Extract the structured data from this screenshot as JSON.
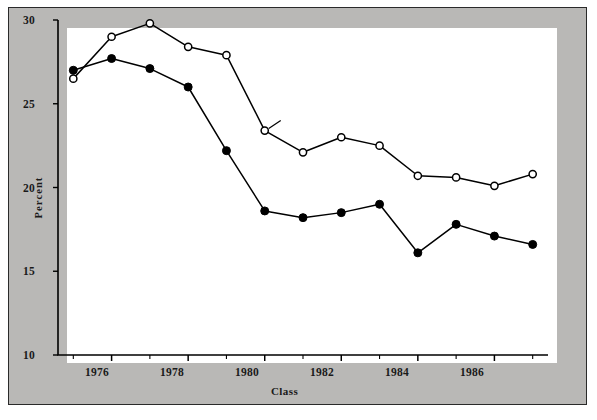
{
  "chart_data": {
    "type": "line",
    "title": "",
    "xlabel": "Class",
    "ylabel": "Percent",
    "xlim": [
      1974.6,
      1987.4
    ],
    "ylim": [
      10,
      30
    ],
    "grid": false,
    "legend_position": "inline-annotation",
    "x": [
      1975,
      1976,
      1977,
      1978,
      1979,
      1980,
      1981,
      1982,
      1983,
      1984,
      1985,
      1986,
      1987
    ],
    "xtick_labels": [
      "1976",
      "1978",
      "1980",
      "1982",
      "1984",
      "1986"
    ],
    "xtick_values": [
      1976,
      1978,
      1980,
      1982,
      1984,
      1986
    ],
    "xtick_minor_values": [
      1975,
      1977,
      1979,
      1981,
      1983,
      1985,
      1987
    ],
    "ytick_labels": [
      "10",
      "15",
      "20",
      "25",
      "30"
    ],
    "ytick_values": [
      10,
      15,
      20,
      25,
      30
    ],
    "series": [
      {
        "name": "Females",
        "marker": "open-circle",
        "values": [
          26.5,
          29.0,
          29.8,
          28.4,
          27.9,
          23.4,
          22.1,
          23.0,
          22.5,
          20.7,
          20.6,
          20.1,
          20.8
        ]
      },
      {
        "name": "Males",
        "marker": "filled-circle",
        "values": [
          27.0,
          27.7,
          27.1,
          26.0,
          22.2,
          18.6,
          18.2,
          18.5,
          19.0,
          16.1,
          17.8,
          17.1,
          16.6
        ]
      }
    ],
    "annotations": [
      {
        "text": "Females",
        "series": "Females"
      },
      {
        "text": "Males",
        "series": "Males"
      }
    ],
    "colors": {
      "line": "#000000",
      "plot_background": "#ffffff",
      "figure_background": "#b9b8b6",
      "frame_border": "#2a2a2a",
      "text": "#1a1a1a"
    }
  }
}
